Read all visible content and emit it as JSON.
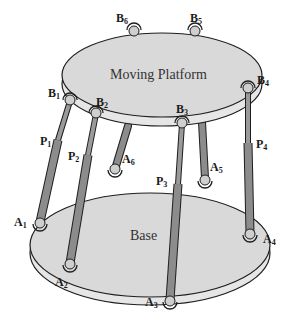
{
  "diagram": {
    "type": "stewart-platform",
    "platform_label": "Moving Platform",
    "base_label": "Base",
    "colors": {
      "surface": "#d9d9d9",
      "edge": "#1e1e1e",
      "rim": "#e6e6e6",
      "leg": "#8c8c8c",
      "leg_dark": "#6e6e6e",
      "joint": "#cfcfcf"
    },
    "upper_joints": [
      {
        "letter": "B",
        "index": "1"
      },
      {
        "letter": "B",
        "index": "2"
      },
      {
        "letter": "B",
        "index": "3"
      },
      {
        "letter": "B",
        "index": "4"
      },
      {
        "letter": "B",
        "index": "5"
      },
      {
        "letter": "B",
        "index": "6"
      }
    ],
    "lower_joints": [
      {
        "letter": "A",
        "index": "1"
      },
      {
        "letter": "A",
        "index": "2"
      },
      {
        "letter": "A",
        "index": "3"
      },
      {
        "letter": "A",
        "index": "4"
      },
      {
        "letter": "A",
        "index": "5"
      },
      {
        "letter": "A",
        "index": "6"
      }
    ],
    "prismatic_labels": [
      {
        "letter": "P",
        "index": "1"
      },
      {
        "letter": "P",
        "index": "2"
      },
      {
        "letter": "P",
        "index": "3"
      },
      {
        "letter": "P",
        "index": "4"
      }
    ]
  }
}
